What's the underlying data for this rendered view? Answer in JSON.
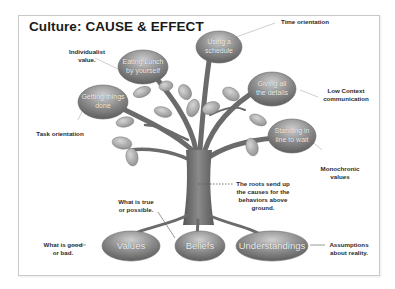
{
  "title": "Culture: CAUSE & EFFECT",
  "colors": {
    "bubble": "#8a8a8a",
    "bubble_light": "#c4c4c4",
    "trunk": "#6f6f6f",
    "leaf": "#a9a9a9",
    "text_dark": "#2b2b2b"
  },
  "behaviors": [
    {
      "text_line1": "Eating Lunch",
      "text_line2": "by yourself",
      "annotation_line1": "Individualist",
      "annotation_line2": "value."
    },
    {
      "text_line1": "Using a",
      "text_line2": "schedule",
      "annotation_line1": "Time orientation",
      "annotation_line2": ""
    },
    {
      "text_line1": "Giving all",
      "text_line2": "the details",
      "annotation_line1": "Low Context",
      "annotation_line2": "communication"
    },
    {
      "text_line1": "Getting things",
      "text_line2": "done",
      "annotation_line1": "Task orientation",
      "annotation_line2": ""
    },
    {
      "text_line1": "Standing in",
      "text_line2": "line to wait",
      "annotation_line1": "Monochronic",
      "annotation_line2": "values"
    }
  ],
  "roots": [
    {
      "text": "Values",
      "annotation_line1": "What is good",
      "annotation_line2": "or bad."
    },
    {
      "text": "Beliefs",
      "annotation_line1": "What is true",
      "annotation_line2": "or possible."
    },
    {
      "text": "Understandings",
      "annotation_line1": "Assumptions",
      "annotation_line2": "about reality."
    }
  ],
  "trunk_note": {
    "line1": "The roots send up",
    "line2": "the causes for the",
    "line3": "behaviors above",
    "line4": "ground."
  }
}
